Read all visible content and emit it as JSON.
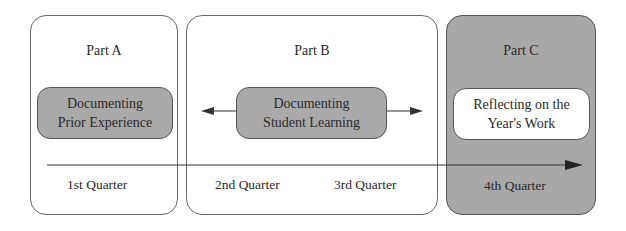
{
  "parts": [
    {
      "title": "Part A",
      "activity": [
        "Documenting",
        "Prior Experience"
      ],
      "quarters": [
        "1st Quarter"
      ]
    },
    {
      "title": "Part B",
      "activity": [
        "Documenting",
        "Student Learning"
      ],
      "quarters": [
        "2nd Quarter",
        "3rd Quarter"
      ]
    },
    {
      "title": "Part C",
      "activity": [
        "Reflecting on the",
        "Year's Work"
      ],
      "quarters": [
        "4th Quarter"
      ]
    }
  ],
  "colors": {
    "shaded_part": "#a8a8a8",
    "activity_grey": "#a9a9a9",
    "line": "#333333"
  }
}
